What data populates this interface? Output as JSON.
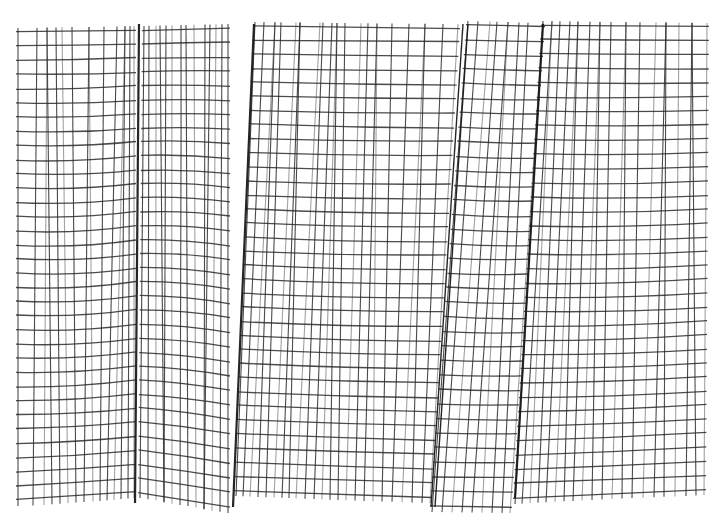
{
  "figure": {
    "background_color": "#ffffff",
    "line_color": "#2b2b2b",
    "bounds": {
      "left": 18,
      "right": 707,
      "top": 22,
      "bottom": 505
    },
    "row_count": 34,
    "regions": [
      {
        "name": "region-left",
        "x_top": [
          18,
          37,
          47,
          56,
          62,
          72,
          89,
          104,
          117,
          125,
          130,
          134
        ],
        "x_bottom": [
          18,
          33,
          44,
          52,
          60,
          68,
          76,
          84,
          93,
          100,
          107,
          114,
          121,
          128,
          134
        ],
        "row_top_start": 32,
        "row_top_end": 30,
        "row_bottom_start": 500,
        "row_bottom_end": 492,
        "sag": 6
      },
      {
        "name": "region-center-left",
        "x_top": [
          144,
          149,
          156,
          160,
          166,
          172,
          181,
          186,
          194,
          205,
          210,
          216,
          222,
          228
        ],
        "x_bottom": [
          140,
          148,
          156,
          164,
          172,
          180,
          188,
          196,
          204,
          212,
          220,
          228
        ],
        "row_top_start": 30,
        "row_top_end": 28,
        "row_bottom_start": 492,
        "row_bottom_end": 507,
        "sag": -4
      },
      {
        "name": "region-center",
        "x_top": [
          255,
          264,
          275,
          281,
          296,
          300,
          320,
          323,
          332,
          337,
          345,
          361,
          368,
          377,
          392,
          409,
          425,
          443,
          458
        ],
        "x_bottom": [
          236,
          243,
          250,
          258,
          266,
          274,
          282,
          289,
          296,
          305,
          314,
          322,
          330,
          338,
          346,
          355,
          364,
          373,
          382,
          392,
          402,
          412,
          422,
          430
        ],
        "row_top_start": 26,
        "row_top_end": 28,
        "row_bottom_start": 490,
        "row_bottom_end": 497,
        "sag": 3
      },
      {
        "name": "region-center-right",
        "x_top": [
          468,
          478,
          490,
          497,
          508,
          519,
          528,
          543
        ],
        "x_bottom": [
          432,
          442,
          452,
          462,
          472,
          482,
          492,
          502,
          510
        ],
        "row_top_start": 25,
        "row_top_end": 27,
        "row_bottom_start": 506,
        "row_bottom_end": 507,
        "sag": 2
      },
      {
        "name": "region-right",
        "x_top": [
          543,
          552,
          560,
          570,
          578,
          590,
          600,
          611,
          626,
          640,
          656,
          666,
          679,
          692,
          707
        ],
        "x_bottom": [
          515,
          522,
          530,
          538,
          546,
          555,
          564,
          573,
          582,
          592,
          602,
          612,
          622,
          632,
          643,
          654,
          664,
          675,
          686,
          696,
          704
        ],
        "row_top_start": 25,
        "row_top_end": 27,
        "row_bottom_start": 498,
        "row_bottom_end": 489,
        "sag": 4
      }
    ],
    "faults": [
      {
        "name": "fault-left",
        "x_top": 139,
        "y_top": 24,
        "x_bottom": 135,
        "y_bottom": 503,
        "double": false
      },
      {
        "name": "fault-center-left",
        "x_top": 254,
        "y_top": 24,
        "x_bottom": 233,
        "y_bottom": 507,
        "double": false
      },
      {
        "name": "fault-center-right-a",
        "x_top": 463,
        "y_top": 24,
        "x_bottom": 431,
        "y_bottom": 507,
        "double": true
      },
      {
        "name": "fault-center-right-b",
        "x_top": 468,
        "y_top": 24,
        "x_bottom": 435,
        "y_bottom": 507,
        "double": true
      },
      {
        "name": "fault-right",
        "x_top": 543,
        "y_top": 24,
        "x_bottom": 515,
        "y_bottom": 498,
        "double": false
      }
    ]
  }
}
